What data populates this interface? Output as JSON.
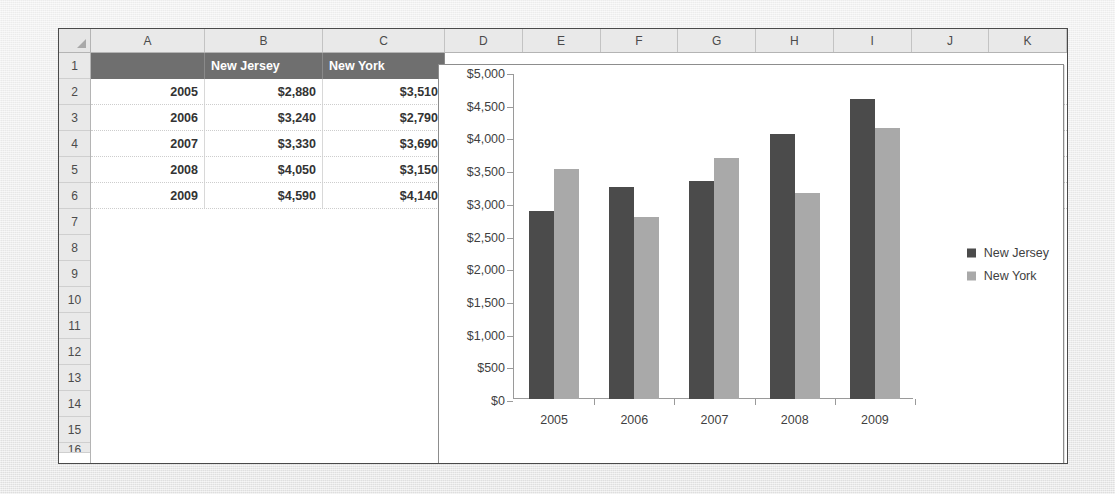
{
  "spreadsheet": {
    "column_headers": [
      "A",
      "B",
      "C",
      "D",
      "E",
      "F",
      "G",
      "H",
      "I",
      "J",
      "K"
    ],
    "row_numbers": [
      "1",
      "2",
      "3",
      "4",
      "5",
      "6",
      "7",
      "8",
      "9",
      "10",
      "11",
      "12",
      "13",
      "14",
      "15"
    ],
    "header_row": {
      "a": "",
      "b": "New Jersey",
      "c": "New York"
    },
    "rows": [
      {
        "a": "2005",
        "b": "$2,880",
        "c": "$3,510"
      },
      {
        "a": "2006",
        "b": "$3,240",
        "c": "$2,790"
      },
      {
        "a": "2007",
        "b": "$3,330",
        "c": "$3,690"
      },
      {
        "a": "2008",
        "b": "$4,050",
        "c": "$3,150"
      },
      {
        "a": "2009",
        "b": "$4,590",
        "c": "$4,140"
      }
    ]
  },
  "chart_data": {
    "type": "bar",
    "title": "",
    "xlabel": "",
    "ylabel": "",
    "categories": [
      "2005",
      "2006",
      "2007",
      "2008",
      "2009"
    ],
    "series": [
      {
        "name": "New Jersey",
        "color": "#4b4b4b",
        "values": [
          2880,
          3240,
          3330,
          4050,
          4590
        ]
      },
      {
        "name": "New York",
        "color": "#a9a9a9",
        "values": [
          3510,
          2790,
          3690,
          3150,
          4140
        ]
      }
    ],
    "ylim": [
      0,
      5000
    ],
    "ytick_step": 500,
    "ytick_labels": [
      "$5,000",
      "$4,500",
      "$4,000",
      "$3,500",
      "$3,000",
      "$2,500",
      "$2,000",
      "$1,500",
      "$1,000",
      "$500",
      "$0"
    ],
    "ytick_values": [
      5000,
      4500,
      4000,
      3500,
      3000,
      2500,
      2000,
      1500,
      1000,
      500,
      0
    ],
    "grid": false,
    "legend_position": "right"
  },
  "colors": {
    "series_new_jersey": "#4b4b4b",
    "series_new_york": "#a9a9a9",
    "header_fill": "#6f6f6f",
    "sheet_background": "#ffffff",
    "page_background": "#e8e8e8"
  }
}
